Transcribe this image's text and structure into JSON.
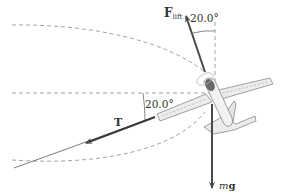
{
  "figure": {
    "type": "free-body diagram",
    "colors": {
      "background": "#ffffff",
      "vector": "#4a4a4a",
      "dashed": "#8a8a8a",
      "plane_fill": "#ececec",
      "plane_stroke": "#7a7a7a",
      "text": "#333333"
    }
  },
  "vectors": [
    {
      "id": "lift",
      "symbol": "F",
      "subscript": "lift",
      "direction": "up, tilted 20.0° from vertical"
    },
    {
      "id": "tension",
      "symbol": "T",
      "direction": "along tether, 20.0° below horizontal"
    },
    {
      "id": "weight",
      "symbol_italic": "m",
      "symbol_bold": "g",
      "direction": "straight down"
    }
  ],
  "angles": {
    "lift_from_vertical": "20.0°",
    "tension_below_horizontal": "20.0°"
  },
  "labels": {
    "lift_main": "F",
    "lift_sub": "lift",
    "lift_angle": "20.0°",
    "tension": "T",
    "tension_angle": "20.0°",
    "weight_m": "m",
    "weight_g": "g"
  }
}
